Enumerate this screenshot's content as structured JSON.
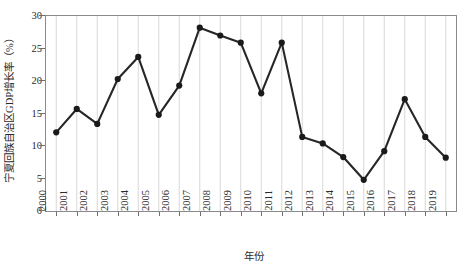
{
  "chart_data": {
    "type": "line",
    "title": "",
    "xlabel": "年份",
    "ylabel": "宁夏回族自治区GDP增长率（%）",
    "categories": [
      "2000",
      "2001",
      "2002",
      "2003",
      "2004",
      "2005",
      "2006",
      "2007",
      "2008",
      "2009",
      "2010",
      "2011",
      "2012",
      "2013",
      "2014",
      "2015",
      "2016",
      "2017",
      "2018",
      "2019"
    ],
    "values": [
      12.1,
      15.7,
      13.4,
      20.3,
      23.7,
      14.8,
      19.3,
      28.2,
      27.0,
      25.9,
      18.1,
      25.9,
      11.4,
      10.4,
      8.3,
      4.8,
      9.2,
      17.2,
      11.4,
      8.2
    ],
    "series": [
      {
        "name": "宁夏回族自治区GDP增长率",
        "values": [
          12.1,
          15.7,
          13.4,
          20.3,
          23.7,
          14.8,
          19.3,
          28.2,
          27.0,
          25.9,
          18.1,
          25.9,
          11.4,
          10.4,
          8.3,
          4.8,
          9.2,
          17.2,
          11.4,
          8.2
        ]
      }
    ],
    "ylim": [
      0,
      30
    ],
    "yticks": [
      0,
      5,
      10,
      15,
      20,
      25,
      30
    ],
    "ytick_labels": [
      "0",
      "5",
      "10",
      "15",
      "20",
      "25",
      "30"
    ],
    "grid": "vertical",
    "legend": "none",
    "line_color": "#262626",
    "marker_color": "#1a1a1a",
    "marker": "circle",
    "gridline_color": "#d4d4d4",
    "axis_color": "#8a8a8a"
  }
}
